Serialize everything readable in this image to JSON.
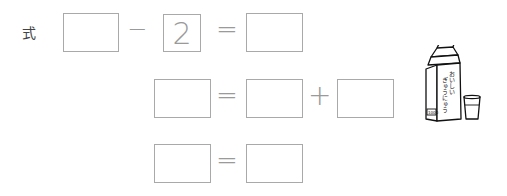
{
  "label": "式",
  "rows": [
    {
      "left": "",
      "op1": "−",
      "mid": "2",
      "eq": "=",
      "right": ""
    },
    {
      "left": "",
      "eq": "=",
      "a": "",
      "op": "+",
      "b": ""
    },
    {
      "left": "",
      "eq": "=",
      "right": ""
    }
  ],
  "illustration": {
    "carton_text_line1": "おいしい",
    "carton_text_line2": "ぎゅうにゅう",
    "carton_volume": "1000",
    "item": "milk-carton-and-glass"
  }
}
